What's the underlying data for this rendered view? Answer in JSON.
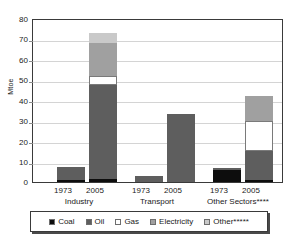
{
  "chart_data": {
    "type": "bar",
    "title": "",
    "xlabel": "",
    "ylabel": "Mtoe",
    "ylim": [
      0,
      80
    ],
    "yticks": [
      0,
      10,
      20,
      30,
      40,
      50,
      60,
      70,
      80
    ],
    "grid": true,
    "stacked": true,
    "legend_position": "bottom",
    "categories": [
      "1973",
      "2005",
      "1973",
      "2005",
      "1973",
      "2005"
    ],
    "groups": [
      {
        "label": "Industry",
        "years": [
          "1973",
          "2005"
        ]
      },
      {
        "label": "Transport",
        "years": [
          "1973",
          "2005"
        ]
      },
      {
        "label": "Other Sectors****",
        "years": [
          "1973",
          "2005"
        ]
      }
    ],
    "series": [
      {
        "name": "Coal",
        "color": "#0d0d0d",
        "values": [
          1.0,
          1.5,
          0.0,
          0.0,
          6.0,
          1.0
        ]
      },
      {
        "name": "Oil",
        "color": "#5e5e5e",
        "values": [
          6.5,
          46.0,
          3.0,
          33.0,
          1.0,
          14.0
        ]
      },
      {
        "name": "Gas",
        "color": "#ffffff",
        "values": [
          0.0,
          4.0,
          0.0,
          0.0,
          0.0,
          15.0
        ]
      },
      {
        "name": "Electricity",
        "color": "#a0a0a0",
        "values": [
          0.0,
          16.5,
          0.0,
          0.0,
          0.0,
          12.0
        ]
      },
      {
        "name": "Other*****",
        "color": "#c9c9c9",
        "values": [
          0.0,
          4.5,
          0.0,
          0.0,
          0.0,
          0.0
        ]
      }
    ],
    "bar_totals": [
      7.5,
      72.0,
      3.0,
      33.0,
      7.0,
      42.0
    ]
  },
  "legend": {
    "items": [
      {
        "label": "Coal",
        "color": "#0d0d0d"
      },
      {
        "label": "Oil",
        "color": "#5e5e5e"
      },
      {
        "label": "Gas",
        "color": "#ffffff"
      },
      {
        "label": "Electricity",
        "color": "#a0a0a0"
      },
      {
        "label": "Other*****",
        "color": "#c9c9c9"
      }
    ]
  },
  "axis": {
    "y_title": "Mtoe",
    "y_labels": [
      "80",
      "70",
      "60",
      "50",
      "40",
      "30",
      "20",
      "10",
      "0"
    ]
  },
  "x_axis": {
    "year_labels": [
      "1973",
      "2005",
      "1973",
      "2005",
      "1973",
      "2005"
    ],
    "group_labels": [
      "Industry",
      "Transport",
      "Other Sectors****"
    ]
  }
}
